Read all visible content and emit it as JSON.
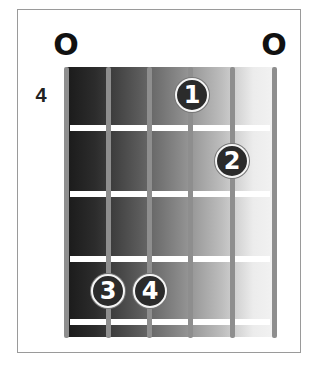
{
  "chord_diagram": {
    "type": "guitar-chord",
    "start_fret": "4",
    "open_strings": [
      {
        "string": 1,
        "marker": "O"
      },
      {
        "string": 6,
        "marker": "O"
      }
    ],
    "strings": 6,
    "frets_shown": 4,
    "fingers": [
      {
        "label": "1",
        "string": 4,
        "fret": 1
      },
      {
        "label": "2",
        "string": 5,
        "fret": 2
      },
      {
        "label": "3",
        "string": 2,
        "fret": 4
      },
      {
        "label": "4",
        "string": 3,
        "fret": 4
      }
    ]
  },
  "colors": {
    "finger_fill": "#2b2b2b",
    "finger_border": "#f4f4f4",
    "string": "#8e8e8e",
    "fret": "#ffffff",
    "frame_border": "#9a9a9a"
  }
}
